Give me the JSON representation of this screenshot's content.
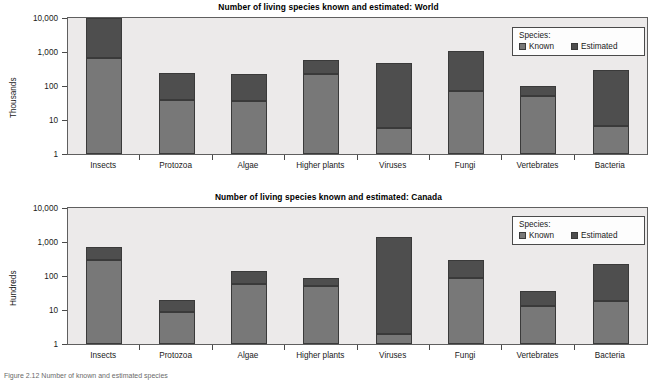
{
  "caption": "Figure 2.12  Number of known and estimated species",
  "legend": {
    "title": "Species:",
    "known_label": "Known",
    "estimated_label": "Estimated",
    "known_color": "#787878",
    "estimated_color": "#4e4e4e"
  },
  "chart_data": [
    {
      "id": "world",
      "type": "bar",
      "title": "Number of living species known and estimated: World",
      "xlabel": "",
      "ylabel": "Thousands",
      "yscale": "log",
      "ylim": [
        1,
        10000
      ],
      "yticks": [
        1,
        10,
        100,
        1000,
        10000
      ],
      "ytick_labels": [
        "1",
        "10",
        "100",
        "1,000",
        "10,000"
      ],
      "grid": false,
      "stacked": true,
      "legend_position": "top-right",
      "categories": [
        "Insects",
        "Protozoa",
        "Algae",
        "Higher plants",
        "Viruses",
        "Fungi",
        "Vertebrates",
        "Bacteria"
      ],
      "series": [
        {
          "name": "Known",
          "values": [
            650,
            38,
            36,
            220,
            6,
            70,
            50,
            6.5
          ]
        },
        {
          "name": "Estimated",
          "values": [
            10000,
            240,
            230,
            590,
            470,
            1100,
            100,
            300
          ]
        }
      ],
      "note": "Estimated values are cumulative bar tops (total); Known is the lower segment."
    },
    {
      "id": "canada",
      "type": "bar",
      "title": "Number of living species known and estimated: Canada",
      "xlabel": "",
      "ylabel": "Hundreds",
      "yscale": "log",
      "ylim": [
        1,
        10000
      ],
      "yticks": [
        1,
        10,
        100,
        1000,
        10000
      ],
      "ytick_labels": [
        "1",
        "10",
        "100",
        "1,000",
        "10,000"
      ],
      "grid": false,
      "stacked": true,
      "legend_position": "top-right",
      "categories": [
        "Insects",
        "Protozoa",
        "Algae",
        "Higher plants",
        "Viruses",
        "Fungi",
        "Vertebrates",
        "Bacteria"
      ],
      "series": [
        {
          "name": "Known",
          "values": [
            290,
            9,
            57,
            50,
            2,
            90,
            13,
            19
          ]
        },
        {
          "name": "Estimated",
          "values": [
            730,
            20,
            140,
            87,
            1400,
            290,
            37,
            230
          ]
        }
      ],
      "note": "Estimated values are cumulative bar tops (total); Known is the lower segment."
    }
  ]
}
